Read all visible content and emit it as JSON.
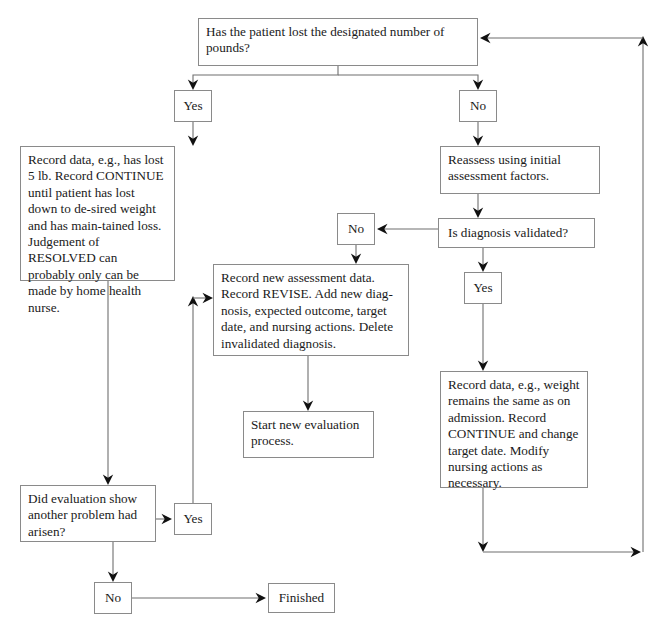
{
  "diagram": {
    "background_color": "#ffffff",
    "line_color": "#6f6f6f",
    "box_border_color": "#8a8a8a",
    "text_color": "#1a1a1a",
    "nodes": [
      {
        "id": "q-lost-pounds",
        "label": "Has the patient lost the designated number of pounds?",
        "x": 198,
        "y": 18,
        "w": 280,
        "h": 48,
        "kind": "question"
      },
      {
        "id": "yes-1",
        "label": "Yes",
        "x": 174,
        "y": 90,
        "w": 38,
        "h": 32,
        "kind": "branch"
      },
      {
        "id": "no-1",
        "label": "No",
        "x": 459,
        "y": 90,
        "w": 38,
        "h": 32,
        "kind": "branch"
      },
      {
        "id": "record-continue",
        "label": "Record data, e.g., has lost 5 lb. Record CONTINUE until patient has lost down to de-sired weight and has main-tained loss. Judgement of RESOLVED can probably only can be made by home health nurse.",
        "x": 20,
        "y": 146,
        "w": 155,
        "h": 135,
        "kind": "action"
      },
      {
        "id": "reassess",
        "label": "Reassess using initial assessment factors.",
        "x": 440,
        "y": 146,
        "w": 160,
        "h": 48,
        "kind": "action"
      },
      {
        "id": "q-diagnosis-validated",
        "label": "Is diagnosis validated?",
        "x": 438,
        "y": 218,
        "w": 157,
        "h": 30,
        "kind": "question"
      },
      {
        "id": "no-2",
        "label": "No",
        "x": 337,
        "y": 213,
        "w": 38,
        "h": 32,
        "kind": "branch"
      },
      {
        "id": "yes-2",
        "label": "Yes",
        "x": 464,
        "y": 272,
        "w": 38,
        "h": 32,
        "kind": "branch"
      },
      {
        "id": "record-revise",
        "label": "Record new assessment data. Record REVISE. Add new diag-nosis, expected outcome, target date, and nursing actions. Delete invalidated diagnosis.",
        "x": 213,
        "y": 264,
        "w": 196,
        "h": 92,
        "kind": "action"
      },
      {
        "id": "record-continue-2",
        "label": "Record data, e.g., weight remains the same as on admission. Record CONTINUE and change target date. Modify nursing actions as necessary.",
        "x": 440,
        "y": 371,
        "w": 148,
        "h": 117,
        "kind": "action"
      },
      {
        "id": "start-new-evaluation",
        "label": "Start new evaluation process.",
        "x": 243,
        "y": 411,
        "w": 131,
        "h": 47,
        "kind": "action"
      },
      {
        "id": "q-another-problem",
        "label": "Did evaluation show another problem had arisen?",
        "x": 20,
        "y": 485,
        "w": 136,
        "h": 57,
        "kind": "question"
      },
      {
        "id": "yes-3",
        "label": "Yes",
        "x": 174,
        "y": 503,
        "w": 38,
        "h": 32,
        "kind": "branch"
      },
      {
        "id": "no-3",
        "label": "No",
        "x": 94,
        "y": 582,
        "w": 38,
        "h": 32,
        "kind": "branch"
      },
      {
        "id": "finished",
        "label": "Finished",
        "x": 268,
        "y": 583,
        "w": 67,
        "h": 30,
        "kind": "terminal"
      }
    ],
    "edges": [
      {
        "id": "edge-question-to-yes1",
        "from": "q-lost-pounds",
        "to": "yes-1",
        "label": "Yes",
        "points": "338,66 338,75 193,75 193,88",
        "arrow_at": "193,90",
        "arrow_dir": "down"
      },
      {
        "id": "edge-question-to-no1",
        "from": "q-lost-pounds",
        "to": "no-1",
        "label": "No",
        "points": "338,75 478,75 478,88",
        "arrow_at": "478,90",
        "arrow_dir": "down"
      },
      {
        "id": "edge-yes1-to-record",
        "from": "yes-1",
        "to": "record-continue",
        "points": "193,122 193,144",
        "arrow_at": "193,146",
        "arrow_dir": "down"
      },
      {
        "id": "edge-no1-to-reassess",
        "from": "no-1",
        "to": "reassess",
        "points": "478,122 478,144",
        "arrow_at": "478,146",
        "arrow_dir": "down"
      },
      {
        "id": "edge-reassess-to-diagnosis",
        "from": "reassess",
        "to": "q-diagnosis-validated",
        "points": "478,194 478,216",
        "arrow_at": "478,218",
        "arrow_dir": "down"
      },
      {
        "id": "edge-diagnosis-to-no2",
        "from": "q-diagnosis-validated",
        "to": "no-2",
        "label": "No",
        "points": "438,229 379,229",
        "arrow_at": "377,229",
        "arrow_dir": "left"
      },
      {
        "id": "edge-diagnosis-to-yes2",
        "from": "q-diagnosis-validated",
        "to": "yes-2",
        "label": "Yes",
        "points": "483,248 483,270",
        "arrow_at": "483,272",
        "arrow_dir": "down"
      },
      {
        "id": "edge-no2-to-revise",
        "from": "no-2",
        "to": "record-revise",
        "points": "356,245 356,262",
        "arrow_at": "356,264",
        "arrow_dir": "down"
      },
      {
        "id": "edge-revise-to-start",
        "from": "record-revise",
        "to": "start-new-evaluation",
        "points": "308,356 308,409",
        "arrow_at": "308,411",
        "arrow_dir": "down"
      },
      {
        "id": "edge-yes2-to-record2",
        "from": "yes-2",
        "to": "record-continue-2",
        "points": "483,304 483,369",
        "arrow_at": "483,371",
        "arrow_dir": "down"
      },
      {
        "id": "edge-record-to-another-problem",
        "from": "record-continue",
        "to": "q-another-problem",
        "points": "108,281 108,483",
        "arrow_at": "108,485",
        "arrow_dir": "down"
      },
      {
        "id": "edge-another-problem-to-yes3",
        "from": "q-another-problem",
        "to": "yes-3",
        "label": "Yes",
        "points": "156,519 170,519",
        "arrow_at": "172,519",
        "arrow_dir": "right"
      },
      {
        "id": "edge-another-problem-to-no3",
        "from": "q-another-problem",
        "to": "no-3",
        "label": "No",
        "points": "113,542 113,580",
        "arrow_at": "113,582",
        "arrow_dir": "down"
      },
      {
        "id": "edge-no3-to-finished",
        "from": "no-3",
        "to": "finished",
        "points": "132,598 264,598",
        "arrow_at": "266,598",
        "arrow_dir": "right"
      },
      {
        "id": "edge-yes3-to-revise-loop",
        "from": "yes-3",
        "to": "record-revise",
        "points": "193,503 193,300",
        "arrow_at": "193,296",
        "arrow_dir": "up"
      },
      {
        "id": "edge-yes3-loop-into-revise",
        "from": "yes-3",
        "to": "record-revise",
        "points": "193,298 211,298",
        "arrow_at": "213,298",
        "arrow_dir": "right"
      },
      {
        "id": "edge-record2-to-top-loop",
        "from": "record-continue-2",
        "to": "q-lost-pounds",
        "points": "483,488 483,548",
        "arrow_at": "483,552",
        "arrow_dir": "down"
      },
      {
        "id": "edge-bottom-right-loop",
        "from": "record-continue-2",
        "to": "q-lost-pounds",
        "points": "483,552 638,552",
        "arrow_at": "641,552",
        "arrow_dir": "right"
      },
      {
        "id": "edge-right-riser",
        "from": "loop",
        "to": "q-lost-pounds",
        "points": "643,552 643,40",
        "arrow_at": "643,36",
        "arrow_dir": "up"
      },
      {
        "id": "edge-top-return",
        "from": "loop",
        "to": "q-lost-pounds",
        "points": "643,38 484,38",
        "arrow_at": "480,38",
        "arrow_dir": "left"
      }
    ]
  }
}
